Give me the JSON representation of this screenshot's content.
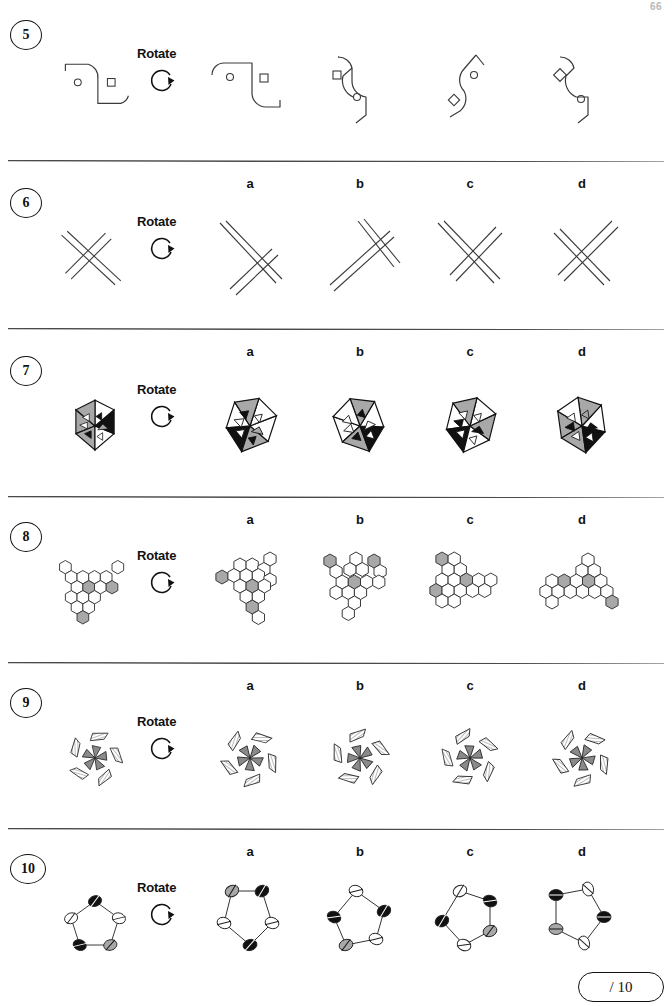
{
  "page": {
    "page_number": "66",
    "score_label": "/ 10"
  },
  "instruction_label": "Rotate",
  "rotate_icon_name": "clockwise-rotate-arrow-icon",
  "option_letters": [
    "a",
    "b",
    "c",
    "d"
  ],
  "questions": [
    {
      "number": "5",
      "instruction": "Rotate",
      "figure_type": "s-curve-with-circle-and-square",
      "target_description": "S-shaped open curve containing a small circle and a small square",
      "options": [
        {
          "letter": "a",
          "description": "S-curve rotated, small circle left and small square right"
        },
        {
          "letter": "b",
          "description": "S-curve rotated 90 degrees, square upper and circle lower"
        },
        {
          "letter": "c",
          "description": "S-curve mirrored, circle upper and diamond lower"
        },
        {
          "letter": "d",
          "description": "S-curve rotated, diamond upper and circle lower"
        }
      ]
    },
    {
      "number": "6",
      "instruction": "Rotate",
      "figure_type": "crossed-diagonal-lines",
      "target_description": "Pair of double parallel lines crossing a pair of single lines at an angle",
      "options": [
        {
          "letter": "a",
          "description": "Crossed line bundle rotated clockwise"
        },
        {
          "letter": "b",
          "description": "Crossed line bundle rotated, long bundle to lower-left"
        },
        {
          "letter": "c",
          "description": "Crossed line bundle rotated, bundle to upper-left"
        },
        {
          "letter": "d",
          "description": "Crossed line bundle, symmetric X shape"
        }
      ]
    },
    {
      "number": "7",
      "instruction": "Rotate",
      "figure_type": "hexagon-six-sectors-with-triangles",
      "target_description": "Hexagon split into six triangular sectors shaded black, grey or white, each containing a small triangle marker",
      "options": [
        {
          "letter": "a",
          "description": "Hexagon rotated, black sectors bottom-left"
        },
        {
          "letter": "b",
          "description": "Hexagon rotated, black sectors bottom-right"
        },
        {
          "letter": "c",
          "description": "Hexagon rotated, black sectors left"
        },
        {
          "letter": "d",
          "description": "Hexagon rotated, black sectors right"
        }
      ]
    },
    {
      "number": "8",
      "instruction": "Rotate",
      "figure_type": "hexagon-tile-cluster",
      "target_description": "Y-shaped cluster of white hexagons with three grey hexagons",
      "options": [
        {
          "letter": "a",
          "description": "Hexagon cluster rotated, grey cells left, centre and bottom"
        },
        {
          "letter": "b",
          "description": "Hexagon cluster rotated, grey cells top-left, top-right and centre"
        },
        {
          "letter": "c",
          "description": "Hexagon cluster rotated, grey cells top-left, left and centre"
        },
        {
          "letter": "d",
          "description": "Hexagon cluster rotated, grey cells left, centre and bottom-right"
        }
      ]
    },
    {
      "number": "9",
      "instruction": "Rotate",
      "figure_type": "pinwheel-with-hatched-arcs",
      "target_description": "Five grey pinwheel blades surrounded by five hatched curved segments",
      "options": [
        {
          "letter": "a",
          "description": "Pinwheel rotated clockwise"
        },
        {
          "letter": "b",
          "description": "Pinwheel rotated, hatched arcs offset"
        },
        {
          "letter": "c",
          "description": "Pinwheel rotated anticlockwise"
        },
        {
          "letter": "d",
          "description": "Pinwheel rotated, arcs evenly spaced"
        }
      ]
    },
    {
      "number": "10",
      "instruction": "Rotate",
      "figure_type": "pentagon-with-split-circles",
      "target_description": "Pentagon outline with a split-fill circle at each of its five vertices",
      "options": [
        {
          "letter": "a",
          "description": "Pentagon rotated, grey top-left, black top-right and bottom"
        },
        {
          "letter": "b",
          "description": "Pentagon rotated, black left and right, grey lower-left"
        },
        {
          "letter": "c",
          "description": "Pentagon rotated, black upper-right and left, grey lower-right"
        },
        {
          "letter": "d",
          "description": "Pentagon rotated, black upper-left and right, grey lower-left"
        }
      ]
    }
  ]
}
